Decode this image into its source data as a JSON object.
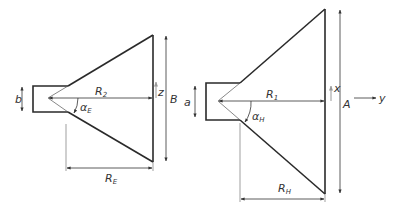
{
  "figure": {
    "colors": {
      "line": "#2a2a2a",
      "dimension": "#333333",
      "background": "#ffffff"
    },
    "e_plane": {
      "labels": {
        "waveguide_height": "b",
        "slant_radius_main": "R",
        "slant_radius_sub": "2",
        "flare_angle_main": "α",
        "flare_angle_sub": "E",
        "axial_length_main": "R",
        "axial_length_sub": "E",
        "aperture_height": "B",
        "axis": "z"
      }
    },
    "h_plane": {
      "labels": {
        "waveguide_width": "a",
        "slant_radius_main": "R",
        "slant_radius_sub": "1",
        "flare_angle_main": "α",
        "flare_angle_sub": "H",
        "axial_length_main": "R",
        "axial_length_sub": "H",
        "aperture_width": "A",
        "axis_x": "x",
        "axis_y": "y"
      }
    }
  }
}
